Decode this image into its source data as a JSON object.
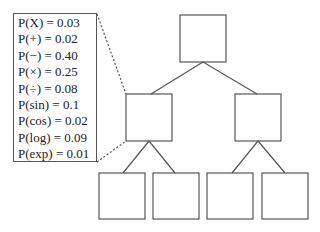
{
  "diagram": {
    "type": "binary-tree",
    "legend": {
      "title": "",
      "rows": [
        {
          "symbol": "X",
          "label": "P(X) = 0.03",
          "value": 0.03
        },
        {
          "symbol": "+",
          "label": "P(+) = 0.02",
          "value": 0.02
        },
        {
          "symbol": "−",
          "label": "P(−) = 0.40",
          "value": 0.4
        },
        {
          "symbol": "×",
          "label": "P(×) = 0.25",
          "value": 0.25
        },
        {
          "symbol": "÷",
          "label": "P(÷) = 0.08",
          "value": 0.08
        },
        {
          "symbol": "sin",
          "label": "P(sin) = 0.1",
          "value": 0.1
        },
        {
          "symbol": "cos",
          "label": "P(cos) = 0.02",
          "value": 0.02
        },
        {
          "symbol": "log",
          "label": "P(log) = 0.09",
          "value": 0.09
        },
        {
          "symbol": "exp",
          "label": "P(exp) = 0.01",
          "value": 0.01
        }
      ]
    },
    "nodes": [
      {
        "id": "root",
        "x": 180,
        "y": 15,
        "w": 46,
        "h": 47
      },
      {
        "id": "left",
        "x": 126,
        "y": 94,
        "w": 46,
        "h": 47
      },
      {
        "id": "right",
        "x": 235,
        "y": 94,
        "w": 46,
        "h": 47
      },
      {
        "id": "ll",
        "x": 99,
        "y": 173,
        "w": 46,
        "h": 46
      },
      {
        "id": "lr",
        "x": 153,
        "y": 173,
        "w": 46,
        "h": 46
      },
      {
        "id": "rl",
        "x": 207,
        "y": 173,
        "w": 46,
        "h": 46
      },
      {
        "id": "rr",
        "x": 262,
        "y": 173,
        "w": 46,
        "h": 46
      }
    ],
    "colors": {
      "stroke": "#555555",
      "text": "#222222"
    }
  }
}
